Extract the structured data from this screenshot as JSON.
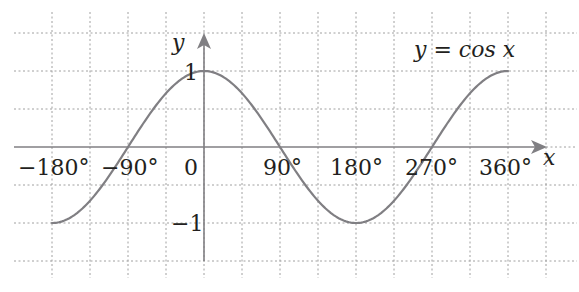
{
  "chart_data": {
    "type": "line",
    "title": "y = cos x",
    "xlabel": "x",
    "ylabel": "y",
    "x_tick_labels": [
      "−180°",
      "−90°",
      "0",
      "90°",
      "180°",
      "270°",
      "360°"
    ],
    "x_ticks": [
      -180,
      -90,
      0,
      90,
      180,
      270,
      360
    ],
    "y_tick_labels": [
      "1",
      "−1"
    ],
    "y_ticks": [
      1,
      -1
    ],
    "xlim": [
      -180,
      360
    ],
    "ylim": [
      -1,
      1
    ],
    "grid": true,
    "grid_style": "dotted",
    "series": [
      {
        "name": "y = cos x",
        "x": [
          -180,
          -135,
          -90,
          -45,
          0,
          45,
          90,
          135,
          180,
          225,
          270,
          315,
          360
        ],
        "values": [
          -1,
          -0.707,
          0,
          0.707,
          1,
          0.707,
          0,
          -0.707,
          -1,
          -0.707,
          0,
          0.707,
          1
        ]
      }
    ]
  },
  "labels": {
    "curve_equation": "y = cos x",
    "x_axis": "x",
    "y_axis": "y",
    "y_one": "1",
    "y_minus_one": "−1",
    "x_m180": "−180°",
    "x_m90": "−90°",
    "x_0": "0",
    "x_90": "90°",
    "x_180": "180°",
    "x_270": "270°",
    "x_360": "360°"
  },
  "colors": {
    "curve": "#807f83",
    "axis": "#807f83",
    "grid": "#9a9a9a",
    "text": "#231f20"
  }
}
